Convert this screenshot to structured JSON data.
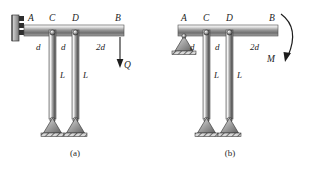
{
  "figure": {
    "type": "structural-mechanics-diagram",
    "background_color": "#ffffff",
    "ink_color": "#1d1d1d",
    "metal_light": "#f2f2f2",
    "metal_mid": "#8e8e8e",
    "metal_dark": "#4a4a4a"
  },
  "panels": [
    {
      "id": "a",
      "caption": "(a)",
      "support_at_A": "fixed-wall-hatched",
      "points": {
        "A": "A",
        "C": "C",
        "D": "D",
        "B": "B"
      },
      "dimensions": [
        {
          "label": "d",
          "span": "A-C"
        },
        {
          "label": "d",
          "span": "C-D"
        },
        {
          "label": "2d",
          "span": "D-B"
        }
      ],
      "vertical_bars": [
        {
          "label": "L",
          "at": "C"
        },
        {
          "label": "L",
          "at": "D"
        }
      ],
      "load": {
        "label": "Q",
        "type": "point-force",
        "direction": "down",
        "applied_at": "B"
      }
    },
    {
      "id": "b",
      "caption": "(b)",
      "support_at_A": "pin-triangle-hatched",
      "points": {
        "A": "A",
        "C": "C",
        "D": "D",
        "B": "B"
      },
      "dimensions": [
        {
          "label": "d",
          "span": "A-C"
        },
        {
          "label": "d",
          "span": "C-D"
        },
        {
          "label": "2d",
          "span": "D-B"
        }
      ],
      "vertical_bars": [
        {
          "label": "L",
          "at": "C"
        },
        {
          "label": "L",
          "at": "D"
        }
      ],
      "load": {
        "label": "M",
        "type": "moment-couple",
        "direction": "clockwise",
        "applied_at": "B"
      }
    }
  ]
}
